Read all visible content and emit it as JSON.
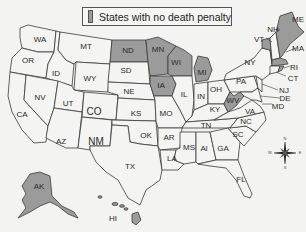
{
  "legend": {
    "label": "States with no death penalty",
    "swatch_color": "#9b9b9b"
  },
  "colors": {
    "no_death_penalty": "#9b9b9b",
    "death_penalty": "#f4f4f2",
    "border": "#3a3a3a",
    "background": "#f3f3f1"
  },
  "states": {
    "WA": "WA",
    "OR": "OR",
    "CA": "CA",
    "ID": "ID",
    "NV": "NV",
    "MT": "MT",
    "WY": "WY",
    "UT": "UT",
    "CO": "CO",
    "AZ": "AZ",
    "NM": "NM",
    "ND": "ND",
    "SD": "SD",
    "NE": "NE",
    "KS": "KS",
    "OK": "OK",
    "TX": "TX",
    "MN": "MN",
    "IA": "IA",
    "MO": "MO",
    "AR": "AR",
    "LA": "LA",
    "WI": "WI",
    "IL": "IL",
    "MI": "MI",
    "IN": "IN",
    "OH": "OH",
    "KY": "KY",
    "TN": "TN",
    "MS": "MS",
    "AL": "Al",
    "GA": "GA",
    "FL": "FL",
    "SC": "SC",
    "NC": "NC",
    "VA": "VA",
    "WV": "WV",
    "PA": "PA",
    "NY": "NY",
    "VT": "VT",
    "NH": "NH",
    "ME": "ME",
    "MA": "MA",
    "RI": "RI",
    "CT": "CT",
    "NJ": "NJ",
    "DE": "DE",
    "MD": "MD",
    "AK": "AK",
    "HI": "HI"
  },
  "no_death_penalty_states": [
    "ND",
    "MN",
    "WI",
    "IA",
    "MI",
    "WV",
    "VT",
    "ME",
    "MA",
    "RI",
    "AK",
    "HI"
  ],
  "compass": {
    "n": "N",
    "s": "S",
    "e": "E",
    "w": "W"
  }
}
